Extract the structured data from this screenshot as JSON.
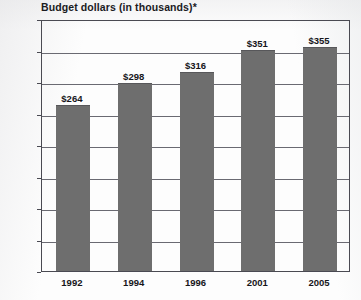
{
  "chart_data": {
    "type": "bar",
    "title": "Budget dollars (in thousands)*",
    "xlabel": "",
    "ylabel": "",
    "categories": [
      "1992",
      "1994",
      "1996",
      "2001",
      "2005"
    ],
    "values": [
      264,
      298,
      316,
      351,
      355
    ],
    "value_labels": [
      "$264",
      "$298",
      "$316",
      "$351",
      "$355"
    ],
    "ylim": [
      0,
      400
    ],
    "ytick_values": [
      0,
      50,
      100,
      150,
      200,
      250,
      300,
      350,
      400
    ],
    "ytick_labels": [
      "$0",
      "$50",
      "$100",
      "$150",
      "$200",
      "$250",
      "$300",
      "$350",
      "$400"
    ],
    "grid": true,
    "legend": "none",
    "series": [
      {
        "name": "Budget dollars",
        "values": [
          264,
          298,
          316,
          351,
          355
        ]
      }
    ],
    "colors": {
      "bar": "#6e6e6e",
      "axis": "#4a4a52",
      "grid": "#6a6a72",
      "text": "#16161a",
      "background": "#fdfdfd"
    }
  }
}
